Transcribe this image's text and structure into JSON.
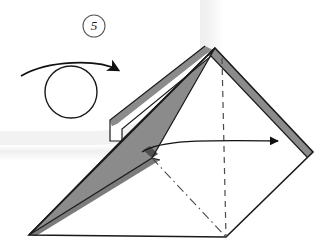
{
  "diagram": {
    "type": "origami-folding-instruction",
    "step_number": "5",
    "step_badge_shape": "circle",
    "background_color": "#ffffff",
    "paper_front_color": "#ffffff",
    "paper_back_color": "#8b8b8b",
    "paper_back_shadow_color": "#6f6f6f",
    "outline_color": "#1a1a1a",
    "crease_color": "#4a4a4a",
    "scan_shadow_color": "#efefef",
    "symbols": [
      {
        "name": "rotate-symbol",
        "label": "rotate / turn model",
        "description": "circle with curved arrow sweeping over the top pointing right",
        "circle_center_x": 71,
        "circle_center_y": 92,
        "circle_radius": 26,
        "arrow_start_x": 21,
        "arrow_start_y": 76,
        "arrow_end_x": 124,
        "arrow_end_y": 73
      },
      {
        "name": "fold-direction-arrow",
        "label": "fold flap to the right",
        "description": "solid horizontal arrow pointing right across the model",
        "arrow_start_x": 142,
        "arrow_start_y": 152,
        "arrow_end_x": 284,
        "arrow_end_y": 141
      }
    ],
    "lines": [
      {
        "name": "valley-crease-vertical",
        "style": "dashed",
        "from_x": 222,
        "from_y": 58,
        "to_x": 226,
        "to_y": 237
      },
      {
        "name": "mountain-crease-diagonal",
        "style": "dash-dot",
        "from_x": 152,
        "from_y": 158,
        "to_x": 226,
        "to_y": 237
      }
    ],
    "vertices": {
      "apex_top": {
        "x": 215,
        "y": 48
      },
      "right_point": {
        "x": 313,
        "y": 152
      },
      "bottom_center": {
        "x": 226,
        "y": 237
      },
      "bottom_left_point": {
        "x": 29,
        "y": 235
      },
      "left_notch": {
        "x": 117,
        "y": 124
      },
      "inner_fold_point": {
        "x": 152,
        "y": 158
      }
    }
  }
}
